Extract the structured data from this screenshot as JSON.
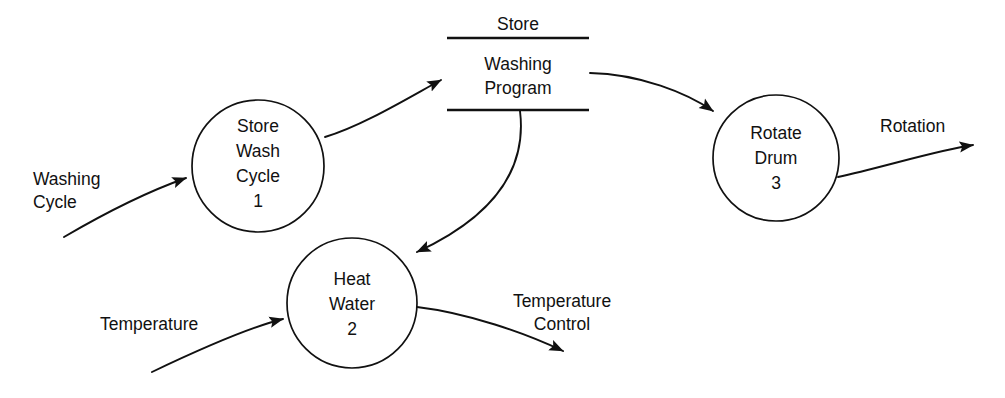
{
  "diagram": {
    "type": "data-flow-diagram",
    "canvas": {
      "width": 1005,
      "height": 398
    },
    "colors": {
      "background": "#ffffff",
      "stroke": "#111111",
      "text": "#111111"
    },
    "processes": [
      {
        "id": "p1",
        "name": "Store Wash Cycle",
        "number": "1",
        "lines": [
          "Store",
          "Wash",
          "Cycle",
          "1"
        ],
        "cx": 258,
        "cy": 166,
        "r": 66
      },
      {
        "id": "p2",
        "name": "Heat Water",
        "number": "2",
        "lines": [
          "Heat",
          "Water",
          "2"
        ],
        "cx": 352,
        "cy": 303,
        "r": 65
      },
      {
        "id": "p3",
        "name": "Rotate Drum",
        "number": "3",
        "lines": [
          "Rotate",
          "Drum",
          "3"
        ],
        "cx": 776,
        "cy": 158,
        "r": 63
      }
    ],
    "datastores": [
      {
        "id": "ds1",
        "header": "Store",
        "lines": [
          "Washing",
          "Program"
        ],
        "x1": 447,
        "x2": 589,
        "top_line_y": 38,
        "bottom_line_y": 110,
        "header_y": 24,
        "body_text_y": [
          65,
          88
        ]
      }
    ],
    "flows": [
      {
        "id": "f1",
        "label_lines": [
          "Washing",
          "Cycle"
        ],
        "from": "external",
        "to": "p1"
      },
      {
        "id": "f2",
        "label_lines": [],
        "from": "p1",
        "to": "ds1"
      },
      {
        "id": "f3",
        "label_lines": [],
        "from": "ds1",
        "to": "p3"
      },
      {
        "id": "f4",
        "label_lines": [],
        "from": "ds1",
        "to": "p2"
      },
      {
        "id": "f5",
        "label_lines": [
          "Temperature"
        ],
        "from": "external",
        "to": "p2"
      },
      {
        "id": "f6",
        "label_lines": [
          "Temperature",
          "Control"
        ],
        "from": "p2",
        "to": "external"
      },
      {
        "id": "f7",
        "label_lines": [
          "Rotation"
        ],
        "from": "p3",
        "to": "external"
      }
    ],
    "labels": {
      "washing_cycle_l1": "Washing",
      "washing_cycle_l2": "Cycle",
      "temperature_in": "Temperature",
      "temperature_control_l1": "Temperature",
      "temperature_control_l2": "Control",
      "rotation": "Rotation",
      "store_header": "Store",
      "store_body_l1": "Washing",
      "store_body_l2": "Program",
      "p1_l1": "Store",
      "p1_l2": "Wash",
      "p1_l3": "Cycle",
      "p1_l4": "1",
      "p2_l1": "Heat",
      "p2_l2": "Water",
      "p2_l3": "2",
      "p3_l1": "Rotate",
      "p3_l2": "Drum",
      "p3_l3": "3"
    }
  }
}
